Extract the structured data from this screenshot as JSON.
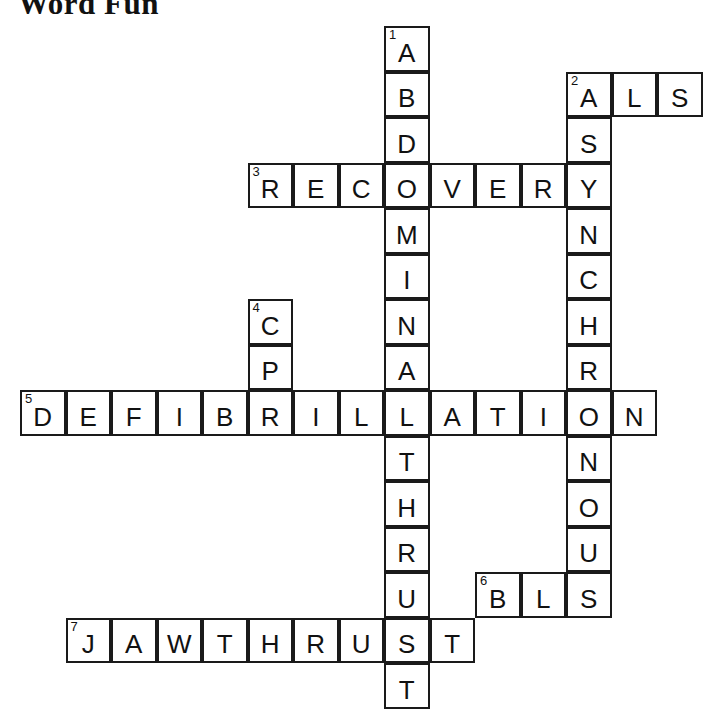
{
  "page": {
    "title": "Word Fun",
    "puzzle_type": "crossword",
    "background_color": "#ffffff",
    "ink_color": "#1a1a1a"
  },
  "grid": {
    "cell_size": 45.5,
    "origin_x": 20,
    "origin_y": 26,
    "columns": 15,
    "rows": 15
  },
  "entries": [
    {
      "number": "1",
      "direction": "down",
      "answer": "ABDOMINALTHRUST",
      "display": "ABDOMINAL THRUST",
      "start_col": 8,
      "start_row": 0,
      "length": 15
    },
    {
      "number": "2",
      "direction": "across",
      "answer": "ALS",
      "display": "ALS",
      "start_col": 12,
      "start_row": 1,
      "length": 3
    },
    {
      "number": "2",
      "direction": "down",
      "answer": "ASYNCHRONOUS",
      "display": "ASYNCHRONOUS",
      "start_col": 12,
      "start_row": 1,
      "length": 12
    },
    {
      "number": "3",
      "direction": "across",
      "answer": "RECOVERY",
      "display": "RECOVERY",
      "start_col": 5,
      "start_row": 3,
      "length": 8
    },
    {
      "number": "4",
      "direction": "down",
      "answer": "CPR",
      "display": "CPR",
      "start_col": 5,
      "start_row": 6,
      "length": 3
    },
    {
      "number": "5",
      "direction": "across",
      "answer": "DEFIBRILLATION",
      "display": "DEFIBRILLATION",
      "start_col": 0,
      "start_row": 8,
      "length": 14
    },
    {
      "number": "6",
      "direction": "across",
      "answer": "BLS",
      "display": "BLS",
      "start_col": 10,
      "start_row": 12,
      "length": 3
    },
    {
      "number": "7",
      "direction": "across",
      "answer": "JAWTHRUST",
      "display": "JAW THRUST",
      "start_col": 1,
      "start_row": 13,
      "length": 9
    }
  ],
  "cells": [
    {
      "col": 8,
      "row": 0,
      "letter": "A",
      "number": "1"
    },
    {
      "col": 8,
      "row": 1,
      "letter": "B",
      "number": ""
    },
    {
      "col": 12,
      "row": 1,
      "letter": "A",
      "number": "2"
    },
    {
      "col": 13,
      "row": 1,
      "letter": "L",
      "number": ""
    },
    {
      "col": 14,
      "row": 1,
      "letter": "S",
      "number": ""
    },
    {
      "col": 8,
      "row": 2,
      "letter": "D",
      "number": ""
    },
    {
      "col": 12,
      "row": 2,
      "letter": "S",
      "number": ""
    },
    {
      "col": 5,
      "row": 3,
      "letter": "R",
      "number": "3"
    },
    {
      "col": 6,
      "row": 3,
      "letter": "E",
      "number": ""
    },
    {
      "col": 7,
      "row": 3,
      "letter": "C",
      "number": ""
    },
    {
      "col": 8,
      "row": 3,
      "letter": "O",
      "number": ""
    },
    {
      "col": 9,
      "row": 3,
      "letter": "V",
      "number": ""
    },
    {
      "col": 10,
      "row": 3,
      "letter": "E",
      "number": ""
    },
    {
      "col": 11,
      "row": 3,
      "letter": "R",
      "number": ""
    },
    {
      "col": 12,
      "row": 3,
      "letter": "Y",
      "number": ""
    },
    {
      "col": 8,
      "row": 4,
      "letter": "M",
      "number": ""
    },
    {
      "col": 12,
      "row": 4,
      "letter": "N",
      "number": ""
    },
    {
      "col": 8,
      "row": 5,
      "letter": "I",
      "number": ""
    },
    {
      "col": 12,
      "row": 5,
      "letter": "C",
      "number": ""
    },
    {
      "col": 5,
      "row": 6,
      "letter": "C",
      "number": "4"
    },
    {
      "col": 8,
      "row": 6,
      "letter": "N",
      "number": ""
    },
    {
      "col": 12,
      "row": 6,
      "letter": "H",
      "number": ""
    },
    {
      "col": 5,
      "row": 7,
      "letter": "P",
      "number": ""
    },
    {
      "col": 8,
      "row": 7,
      "letter": "A",
      "number": ""
    },
    {
      "col": 12,
      "row": 7,
      "letter": "R",
      "number": ""
    },
    {
      "col": 0,
      "row": 8,
      "letter": "D",
      "number": "5"
    },
    {
      "col": 1,
      "row": 8,
      "letter": "E",
      "number": ""
    },
    {
      "col": 2,
      "row": 8,
      "letter": "F",
      "number": ""
    },
    {
      "col": 3,
      "row": 8,
      "letter": "I",
      "number": ""
    },
    {
      "col": 4,
      "row": 8,
      "letter": "B",
      "number": ""
    },
    {
      "col": 5,
      "row": 8,
      "letter": "R",
      "number": ""
    },
    {
      "col": 6,
      "row": 8,
      "letter": "I",
      "number": ""
    },
    {
      "col": 7,
      "row": 8,
      "letter": "L",
      "number": ""
    },
    {
      "col": 8,
      "row": 8,
      "letter": "L",
      "number": ""
    },
    {
      "col": 9,
      "row": 8,
      "letter": "A",
      "number": ""
    },
    {
      "col": 10,
      "row": 8,
      "letter": "T",
      "number": ""
    },
    {
      "col": 11,
      "row": 8,
      "letter": "I",
      "number": ""
    },
    {
      "col": 12,
      "row": 8,
      "letter": "O",
      "number": ""
    },
    {
      "col": 13,
      "row": 8,
      "letter": "N",
      "number": ""
    },
    {
      "col": 8,
      "row": 9,
      "letter": "T",
      "number": ""
    },
    {
      "col": 12,
      "row": 9,
      "letter": "N",
      "number": ""
    },
    {
      "col": 8,
      "row": 10,
      "letter": "H",
      "number": ""
    },
    {
      "col": 12,
      "row": 10,
      "letter": "O",
      "number": ""
    },
    {
      "col": 8,
      "row": 11,
      "letter": "R",
      "number": ""
    },
    {
      "col": 12,
      "row": 11,
      "letter": "U",
      "number": ""
    },
    {
      "col": 8,
      "row": 12,
      "letter": "U",
      "number": ""
    },
    {
      "col": 10,
      "row": 12,
      "letter": "B",
      "number": "6"
    },
    {
      "col": 11,
      "row": 12,
      "letter": "L",
      "number": ""
    },
    {
      "col": 12,
      "row": 12,
      "letter": "S",
      "number": ""
    },
    {
      "col": 1,
      "row": 13,
      "letter": "J",
      "number": "7"
    },
    {
      "col": 2,
      "row": 13,
      "letter": "A",
      "number": ""
    },
    {
      "col": 3,
      "row": 13,
      "letter": "W",
      "number": ""
    },
    {
      "col": 4,
      "row": 13,
      "letter": "T",
      "number": ""
    },
    {
      "col": 5,
      "row": 13,
      "letter": "H",
      "number": ""
    },
    {
      "col": 6,
      "row": 13,
      "letter": "R",
      "number": ""
    },
    {
      "col": 7,
      "row": 13,
      "letter": "U",
      "number": ""
    },
    {
      "col": 8,
      "row": 13,
      "letter": "S",
      "number": ""
    },
    {
      "col": 9,
      "row": 13,
      "letter": "T",
      "number": ""
    },
    {
      "col": 8,
      "row": 14,
      "letter": "T",
      "number": ""
    }
  ]
}
